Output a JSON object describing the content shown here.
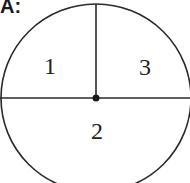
{
  "figure": {
    "label": "A:",
    "circle": {
      "cx": 96,
      "cy": 98,
      "rx": 95,
      "ry": 94,
      "stroke": "#2a2a2a"
    },
    "center_dot": {
      "cx": 96,
      "cy": 98,
      "r": 3.5
    },
    "horizontal_diameter": {
      "x1": 0,
      "y1": 98,
      "x2": 190,
      "y2": 98
    },
    "vertical_radius": {
      "x1": 96,
      "y1": 4,
      "x2": 96,
      "y2": 98
    },
    "regions": [
      {
        "id": "region-1",
        "label": "1",
        "x": 50,
        "y": 74
      },
      {
        "id": "region-3",
        "label": "3",
        "x": 145,
        "y": 75
      },
      {
        "id": "region-2",
        "label": "2",
        "x": 97,
        "y": 139
      }
    ]
  }
}
